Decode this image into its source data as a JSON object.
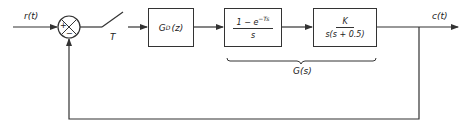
{
  "diagram": {
    "input_label": "r(t)",
    "output_label": "c(t)",
    "summer": {
      "plus_sign": "+",
      "minus_sign": "−"
    },
    "sampler_label": "T",
    "controller_block": {
      "label": "G",
      "subscript": "D",
      "arg": "(z)"
    },
    "zoh_block": {
      "numerator": "1 − e",
      "exponent": "−Ts",
      "denominator": "s"
    },
    "plant_block": {
      "numerator": "K",
      "denominator": "s(s + 0.5)"
    },
    "brace_label": "G(s)",
    "colors": {
      "line": "#333333",
      "background": "#ffffff"
    }
  }
}
